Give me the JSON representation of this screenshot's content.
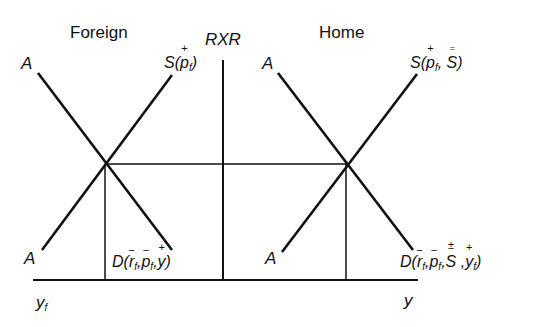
{
  "panels": {
    "foreign": {
      "title": "Foreign",
      "a_label_top": "A",
      "a_label_bottom": "A",
      "supply_label": {
        "fn": "S(",
        "arg1": "p",
        "arg1_sub": "f",
        "arg1_sign": "+",
        "close": ")"
      },
      "demand_label": {
        "fn": "D(",
        "arg1": "r",
        "arg1_sub": "f",
        "arg1_sign": "−",
        "arg2": "p",
        "arg2_sub": "f",
        "arg2_sign": "−",
        "arg3": "y",
        "arg3_sign": "+",
        "close": ")"
      },
      "axis_label": {
        "base": "y",
        "sub": "f"
      }
    },
    "center": {
      "axis_label": "RXR"
    },
    "home": {
      "title": "Home",
      "a_label_top": "A",
      "a_label_bottom": "A",
      "supply_label": {
        "fn": "S(",
        "arg1": "p",
        "arg1_sub": "f",
        "arg1_sign": "+",
        "arg2": "S",
        "arg2_sign": "=",
        "close": ")"
      },
      "demand_label": {
        "fn": "D(",
        "arg1": "r",
        "arg1_sub": "f",
        "arg1_sign": "−",
        "arg2": "p",
        "arg2_sub": "f",
        "arg2_sign": "−",
        "arg3": "S",
        "arg3_sign": "±",
        "arg4": "y",
        "arg4_sub": "f",
        "arg4_sign": "+",
        "close": ")"
      },
      "axis_label": "y"
    }
  },
  "geometry": {
    "x_axis": {
      "x1": 33,
      "x2": 418,
      "y": 280
    },
    "rxr_axis": {
      "x": 223,
      "y1": 60,
      "y2": 280
    },
    "foreign_equilibrium": {
      "x": 105,
      "y": 164
    },
    "home_equilibrium": {
      "x": 346,
      "y": 164
    },
    "line_color": "#111111"
  }
}
